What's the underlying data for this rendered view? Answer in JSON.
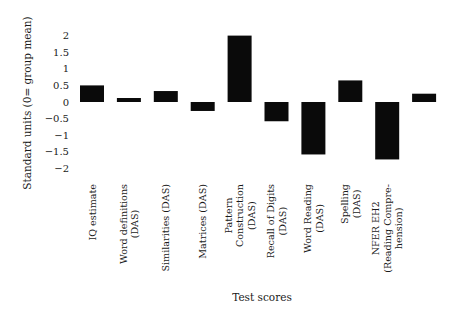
{
  "chart_data": {
    "type": "bar",
    "title": "",
    "xlabel": "Test scores",
    "ylabel": "Standard units (0= group mean)",
    "ylim": [
      -2,
      2
    ],
    "yticks": [
      "2",
      "1.5",
      "1",
      "0.5",
      "0",
      "-0.5",
      "-1",
      "-1.5",
      "-2"
    ],
    "ytick_values": [
      2,
      1.5,
      1,
      0.5,
      0,
      -0.5,
      -1,
      -1.5,
      -2
    ],
    "grid": false,
    "bar_color": "#0a0a0a",
    "categories": [
      [
        "IQ estimate"
      ],
      [
        "Word definitions",
        "(DAS)"
      ],
      [
        "Similarities (DAS)"
      ],
      [
        "Matrices (DAS)"
      ],
      [
        "Pattern",
        "Construction",
        "(DAS)"
      ],
      [
        "Recall of Digits",
        "(DAS)"
      ],
      [
        "Word Reading",
        "(DAS)"
      ],
      [
        "Spelling",
        "(DAS)"
      ],
      [
        "NFER EH2",
        "(Reading Compre-",
        "hension)"
      ],
      [
        ""
      ]
    ],
    "values": [
      0.5,
      0.12,
      0.33,
      -0.27,
      2.0,
      -0.58,
      -1.58,
      0.65,
      -1.73,
      0.25
    ]
  }
}
